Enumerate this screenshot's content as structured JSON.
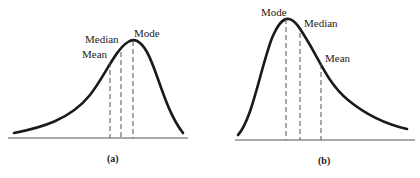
{
  "panels": [
    {
      "id": "a",
      "caption": "(a)",
      "skew": "negative",
      "labels": {
        "mean": "Mean",
        "median": "Median",
        "mode": "Mode"
      },
      "order_left_to_right": [
        "Mean",
        "Median",
        "Mode"
      ]
    },
    {
      "id": "b",
      "caption": "(b)",
      "skew": "positive",
      "labels": {
        "mode": "Mode",
        "median": "Median",
        "mean": "Mean"
      },
      "order_left_to_right": [
        "Mode",
        "Median",
        "Mean"
      ]
    }
  ],
  "colors": {
    "curve": "#1a1a1a",
    "lines": "#555555",
    "text": "#222222",
    "background": "#ffffff"
  }
}
